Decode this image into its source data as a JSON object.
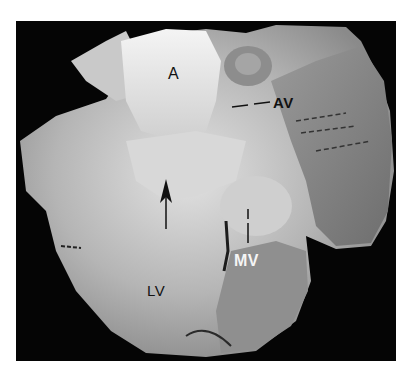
{
  "figure": {
    "background_color": "#050505",
    "tissue_tone": "#bdbdbd",
    "labels": [
      {
        "id": "aorta",
        "text": "A",
        "color": "#111111"
      },
      {
        "id": "aortic-valve",
        "text": "AV",
        "color": "#111111"
      },
      {
        "id": "mitral-valve",
        "text": "MV",
        "color": "#f5f5f5"
      },
      {
        "id": "left-ventricle",
        "text": "LV",
        "color": "#111111"
      }
    ],
    "annotations": [
      {
        "id": "arrow",
        "type": "upward-arrow",
        "color": "#111111"
      },
      {
        "id": "av-leader",
        "type": "dashed-leader-line",
        "color": "#111111"
      },
      {
        "id": "mv-leader",
        "type": "dashed-leader-line",
        "color": "#111111"
      }
    ]
  }
}
